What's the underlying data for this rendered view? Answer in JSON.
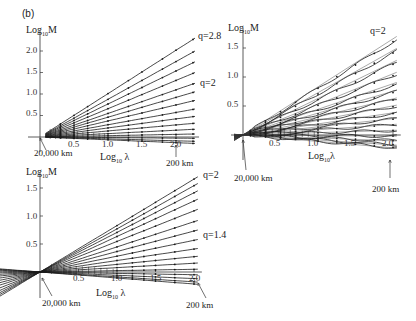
{
  "figure": {
    "panel_label": "(b)"
  },
  "chart_data": [
    {
      "type": "line",
      "title": "",
      "xlabel": "Log10 λ",
      "ylabel": "Log10 M",
      "x_ticks": [
        "0.5",
        "1.0",
        "1.5",
        "2.0"
      ],
      "y_ticks": [
        "0.5",
        "1.0",
        "1.5",
        "2.0"
      ],
      "xlim": [
        -0.15,
        2.3
      ],
      "ylim": [
        -0.15,
        2.4
      ],
      "grid": false,
      "annotations": [
        {
          "text": "q=2.8",
          "at": "top line end"
        },
        {
          "text": "q=2",
          "at": "middle line end"
        },
        {
          "text": "20,000 km",
          "at": "origin (arrow)"
        },
        {
          "text": "200 km",
          "at": "x≈2.0 (arrow)"
        }
      ],
      "series_description": "Fan of straight lines from origin, slopes (q-1) from +1.0 down to about -0.15, with dot markers",
      "series": [
        {
          "name": "q=2.8",
          "end_y": 2.3
        },
        {
          "name": "line2",
          "end_y": 2.0
        },
        {
          "name": "line3",
          "end_y": 1.75
        },
        {
          "name": "line4",
          "end_y": 1.5
        },
        {
          "name": "q=2",
          "end_y": 1.25
        },
        {
          "name": "line6",
          "end_y": 1.05
        },
        {
          "name": "line7",
          "end_y": 0.85
        },
        {
          "name": "line8",
          "end_y": 0.65
        },
        {
          "name": "line9",
          "end_y": 0.48
        },
        {
          "name": "line10",
          "end_y": 0.32
        },
        {
          "name": "line11",
          "end_y": 0.18
        },
        {
          "name": "line12",
          "end_y": 0.07
        },
        {
          "name": "line13",
          "end_y": -0.03
        },
        {
          "name": "line14",
          "end_y": -0.1
        },
        {
          "name": "line15",
          "end_y": -0.15
        }
      ]
    },
    {
      "type": "line",
      "title": "",
      "xlabel": "Log10 λ",
      "ylabel": "Log10 M",
      "x_ticks": [
        "0.5",
        "1.0",
        "1.5",
        "2.0"
      ],
      "y_ticks": [
        "0.5",
        "1.0",
        "1.5"
      ],
      "xlim": [
        -0.15,
        2.15
      ],
      "ylim": [
        -0.25,
        1.7
      ],
      "grid": false,
      "annotations": [
        {
          "text": "q=2",
          "at": "top line end"
        },
        {
          "text": "20,000 km",
          "at": "origin (arrow)"
        },
        {
          "text": "200 km",
          "at": "x≈2.0 (arrow)"
        }
      ],
      "series_description": "Fan of empirical (wiggly) lines plus straight reference lines from origin",
      "series": [
        {
          "name": "q=2",
          "end_y": 1.65
        },
        {
          "name": "line2",
          "end_y": 1.45
        },
        {
          "name": "line3",
          "end_y": 1.25
        },
        {
          "name": "line4",
          "end_y": 1.05
        },
        {
          "name": "line5",
          "end_y": 0.88
        },
        {
          "name": "line6",
          "end_y": 0.75
        },
        {
          "name": "line7",
          "end_y": 0.62
        },
        {
          "name": "line8",
          "end_y": 0.5
        },
        {
          "name": "line9",
          "end_y": 0.38
        },
        {
          "name": "line10",
          "end_y": 0.28
        },
        {
          "name": "line11",
          "end_y": 0.18
        },
        {
          "name": "line12",
          "end_y": 0.08
        },
        {
          "name": "line13",
          "end_y": -0.02
        },
        {
          "name": "line14",
          "end_y": -0.1
        },
        {
          "name": "line15",
          "end_y": -0.17
        },
        {
          "name": "line16",
          "end_y": -0.22
        }
      ]
    },
    {
      "type": "line",
      "title": "",
      "xlabel": "Log10 λ",
      "ylabel": "Log10 M",
      "x_ticks": [
        "0.5",
        "1.0",
        "1.5",
        "2.0"
      ],
      "y_ticks": [
        "0.5",
        "1.0",
        "1.5"
      ],
      "xlim": [
        -0.7,
        2.1
      ],
      "ylim": [
        -0.25,
        1.75
      ],
      "grid": false,
      "annotations": [
        {
          "text": "q=2",
          "at": "top line end"
        },
        {
          "text": "q=1.4",
          "at": "middle line end"
        },
        {
          "text": "20,000 km",
          "at": "origin (arrow)"
        },
        {
          "text": "200 km",
          "at": "x≈2.0 (arrow)"
        }
      ],
      "series_description": "Fan of straight lines from origin (extending to negative x) with dot markers in x≈1.0–2.0 range",
      "series": [
        {
          "name": "q=2",
          "end_y": 1.7
        },
        {
          "name": "line2",
          "end_y": 1.58
        },
        {
          "name": "line3",
          "end_y": 1.45
        },
        {
          "name": "line4",
          "end_y": 1.3
        },
        {
          "name": "line5",
          "end_y": 1.12
        },
        {
          "name": "line6",
          "end_y": 0.92
        },
        {
          "name": "line7",
          "end_y": 0.75
        },
        {
          "name": "q=1.4",
          "end_y": 0.58
        },
        {
          "name": "line9",
          "end_y": 0.42
        },
        {
          "name": "line10",
          "end_y": 0.28
        },
        {
          "name": "line11",
          "end_y": 0.16
        },
        {
          "name": "line12",
          "end_y": 0.05
        },
        {
          "name": "line13",
          "end_y": -0.05
        },
        {
          "name": "line14",
          "end_y": -0.12
        },
        {
          "name": "line15",
          "end_y": -0.18
        },
        {
          "name": "line16",
          "end_y": -0.22
        }
      ]
    }
  ],
  "labels": {
    "a": {
      "ylabel": "Log",
      "ysub": "10",
      "yM": "M",
      "xlabel": "Log",
      "xsub": "10",
      "xL": "λ",
      "ticks_y": [
        "0.5",
        "1.0",
        "1.5",
        "2.0"
      ],
      "ticks_x": [
        "0.5",
        "1.0",
        "1.5",
        "2.0"
      ],
      "q_top": "q=2.8",
      "q_mid": "q=2",
      "km_left": "20,000 km",
      "km_right": "200 km"
    },
    "b": {
      "ylabel": "Log",
      "ysub": "10",
      "yM": "M",
      "xlabel": "Log",
      "xsub": "10",
      "xL": "λ",
      "ticks_y": [
        "0.5",
        "1.0",
        "1.5"
      ],
      "ticks_x": [
        "0.5",
        "1.0",
        "1.5",
        "2.0"
      ],
      "q_top": "q=2",
      "km_left": "20,000 km",
      "km_right": "200 km"
    },
    "c": {
      "ylabel": "Log",
      "ysub": "10",
      "yM": "M",
      "xlabel": "Log",
      "xsub": "10",
      "xL": "λ",
      "ticks_y": [
        "0.5",
        "1.0",
        "1.5"
      ],
      "ticks_x": [
        "0.5",
        "1.0",
        "1.5",
        "2.0"
      ],
      "q_top": "q=2",
      "q_mid": "q=1.4",
      "km_left": "20,000 km",
      "km_right": "200 km"
    }
  },
  "colors": {
    "line": "#1a1a1a",
    "axis": "#333333",
    "text": "#222222"
  }
}
